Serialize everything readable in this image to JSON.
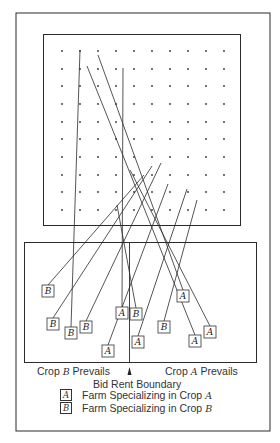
{
  "figure": {
    "grid": {
      "columns_x": [
        62,
        80,
        98,
        116,
        134,
        152,
        170,
        188,
        206,
        224
      ],
      "rows_y": [
        51,
        69,
        86,
        104,
        122,
        139,
        157,
        175,
        192,
        210
      ]
    },
    "farms": [
      {
        "crop": "B",
        "x": 48,
        "y": 291,
        "from": [
          144,
          175
        ]
      },
      {
        "crop": "B",
        "x": 53,
        "y": 324,
        "from": [
          152,
          166
        ]
      },
      {
        "crop": "B",
        "x": 71,
        "y": 333,
        "from": [
          80,
          50
        ]
      },
      {
        "crop": "B",
        "x": 86,
        "y": 327,
        "from": [
          161,
          163
        ]
      },
      {
        "crop": "A",
        "x": 108,
        "y": 351,
        "from": [
          168,
          184
        ]
      },
      {
        "crop": "A",
        "x": 122,
        "y": 313,
        "from": [
          123,
          68
        ]
      },
      {
        "crop": "B",
        "x": 136,
        "y": 314,
        "from": [
          117,
          205
        ]
      },
      {
        "crop": "A",
        "x": 138,
        "y": 342,
        "from": [
          187,
          189
        ]
      },
      {
        "crop": "B",
        "x": 164,
        "y": 327,
        "from": [
          197,
          200
        ]
      },
      {
        "crop": "A",
        "x": 183,
        "y": 296,
        "from": [
          98,
          55
        ]
      },
      {
        "crop": "A",
        "x": 195,
        "y": 341,
        "from": [
          87,
          66
        ]
      },
      {
        "crop": "A",
        "x": 210,
        "y": 332,
        "from": [
          130,
          170
        ]
      }
    ]
  },
  "labels": {
    "crop_b_prevails_prefix": "Crop ",
    "crop_b_letter": "B",
    "crop_b_prevails_suffix": " Prevails",
    "crop_a_prevails_prefix": "Crop ",
    "crop_a_letter": "A",
    "crop_a_prevails_suffix": " Prevails",
    "boundary": "Bid Rent Boundary"
  },
  "legend": {
    "a_symbol": "A",
    "a_text_prefix": "Farm Specializing in Crop ",
    "a_text_letter": "A",
    "b_symbol": "B",
    "b_text_prefix": "Farm Specializing in Crop ",
    "b_text_letter": "B"
  }
}
